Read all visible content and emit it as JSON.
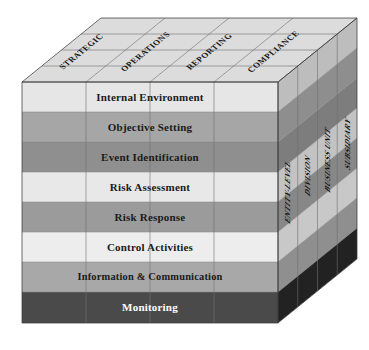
{
  "figure": {
    "name": "COSO Enterprise Risk Management Cube",
    "geometry": "isometric-cube",
    "faces": 3
  },
  "front_face": {
    "name": "components",
    "rows": [
      {
        "label": "Internal Environment",
        "fill": "#e6e6e6",
        "text_color": "#1a1a1a"
      },
      {
        "label": "Objective Setting",
        "fill": "#a6a6a6",
        "text_color": "#1a1a1a"
      },
      {
        "label": "Event Identification",
        "fill": "#8f8f8f",
        "text_color": "#1a1a1a"
      },
      {
        "label": "Risk Assessment",
        "fill": "#e8e8e8",
        "text_color": "#1a1a1a"
      },
      {
        "label": "Risk Response",
        "fill": "#9b9b9b",
        "text_color": "#1a1a1a"
      },
      {
        "label": "Control Activities",
        "fill": "#ededed",
        "text_color": "#1a1a1a"
      },
      {
        "label": "Information & Communication",
        "fill": "#a8a8a8",
        "text_color": "#1a1a1a"
      },
      {
        "label": "Monitoring",
        "fill": "#4a4a4a",
        "text_color": "#ffffff"
      }
    ],
    "column_dividers": 4
  },
  "top_face": {
    "name": "objectives",
    "columns": [
      {
        "label": "STRATEGIC",
        "fill": "#dcdcdc"
      },
      {
        "label": "OPERATIONS",
        "fill": "#dcdcdc"
      },
      {
        "label": "REPORTING",
        "fill": "#dcdcdc"
      },
      {
        "label": "COMPLIANCE",
        "fill": "#dcdcdc"
      }
    ]
  },
  "right_face": {
    "name": "entity-levels",
    "columns": [
      {
        "label": "ENTITY-LEVEL",
        "fill": "#8c8c8c"
      },
      {
        "label": "DIVISION",
        "fill": "#9a9a9a"
      },
      {
        "label": "BUSINESS UNIT",
        "fill": "#8a8a8a"
      },
      {
        "label": "SUBSIDIARY",
        "fill": "#979797"
      }
    ]
  },
  "colors": {
    "background": "#ffffff",
    "edge_stroke": "#3c3c3c",
    "grid_stroke": "#6e6e6e",
    "dark_band": "#4a4a4a",
    "darkest_side": "#222222",
    "light_band": "#e8e8e8"
  }
}
